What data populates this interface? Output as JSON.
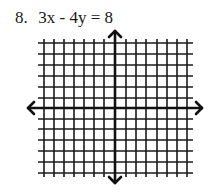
{
  "problem": {
    "number": "8.",
    "equation": "3x - 4y = 8"
  },
  "graph": {
    "type": "blank coordinate grid",
    "grid_columns": 14,
    "grid_rows": 12,
    "vertical_lines": 15,
    "horizontal_lines": 13,
    "axes": [
      "x-axis",
      "y-axis"
    ],
    "arrows": [
      "up",
      "down",
      "left",
      "right"
    ],
    "line_color": "#1a1a1a"
  }
}
